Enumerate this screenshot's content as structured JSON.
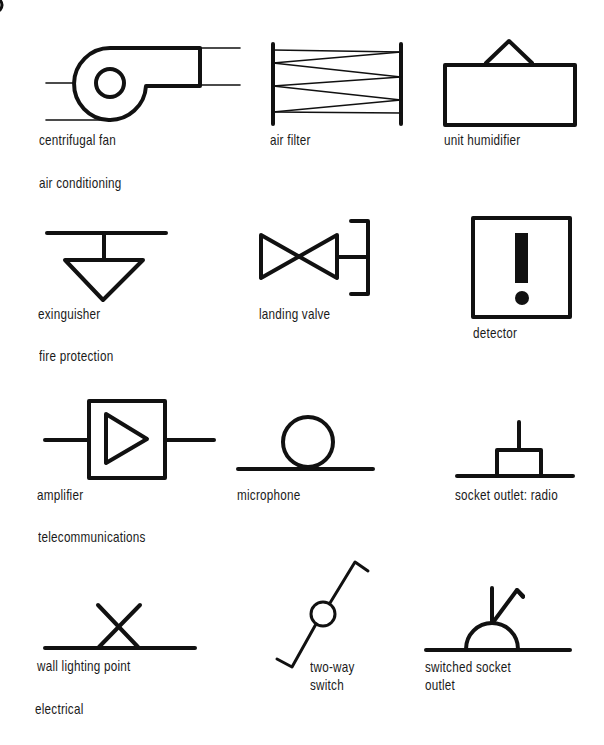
{
  "diagram": {
    "sections": [
      {
        "id": "air-conditioning",
        "title": "air conditioning",
        "symbols": [
          {
            "id": "centrifugal-fan",
            "label": "centrifugal fan"
          },
          {
            "id": "air-filter",
            "label": "air filter"
          },
          {
            "id": "unit-humidifier",
            "label": "unit humidifier"
          }
        ]
      },
      {
        "id": "fire-protection",
        "title": "fire protection",
        "symbols": [
          {
            "id": "extinguisher",
            "label": "exinguisher"
          },
          {
            "id": "landing-valve",
            "label": "landing valve"
          },
          {
            "id": "detector",
            "label": "detector"
          }
        ]
      },
      {
        "id": "telecommunications",
        "title": "telecommunications",
        "symbols": [
          {
            "id": "amplifier",
            "label": "amplifier"
          },
          {
            "id": "microphone",
            "label": "microphone"
          },
          {
            "id": "socket-outlet-radio",
            "label": "socket outlet: radio"
          }
        ]
      },
      {
        "id": "electrical",
        "title": "electrical",
        "symbols": [
          {
            "id": "wall-lighting-point",
            "label": "wall lighting point"
          },
          {
            "id": "two-way-switch",
            "label_line1": "two-way",
            "label_line2": "switch"
          },
          {
            "id": "switched-socket-outlet",
            "label_line1": "switched socket",
            "label_line2": "outlet"
          }
        ]
      }
    ],
    "colors": {
      "ink": "#111111",
      "background": "#ffffff"
    }
  }
}
